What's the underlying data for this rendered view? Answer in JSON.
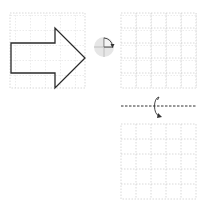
{
  "diagram": {
    "grid_color": "#c8c8c8",
    "shape_stroke": "#2a2a2a",
    "grids": [
      {
        "name": "source-grid",
        "x": 10,
        "y": 13,
        "cells": 5,
        "cell_size": 15
      },
      {
        "name": "rotation-target-grid",
        "x": 121,
        "y": 13,
        "cells": 5,
        "cell_size": 15
      },
      {
        "name": "reflection-target-grid",
        "x": 121,
        "y": 124,
        "cells": 5,
        "cell_size": 15
      }
    ],
    "shape": {
      "type": "arrow-right",
      "points": [
        [
          11,
          43
        ],
        [
          55,
          43
        ],
        [
          55,
          28
        ],
        [
          85,
          58
        ],
        [
          55,
          88
        ],
        [
          55,
          73
        ],
        [
          11,
          73
        ]
      ]
    },
    "rotation_icon": {
      "type": "rotate-90-clockwise",
      "cx": 104,
      "cy": 47,
      "r": 10
    },
    "reflection_axis": {
      "type": "horizontal-flip",
      "y": 106,
      "x1": 121,
      "x2": 196
    }
  }
}
